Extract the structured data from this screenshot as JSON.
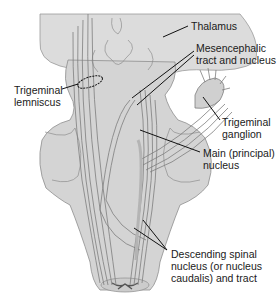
{
  "figure": {
    "type": "anatomical-diagram",
    "colors": {
      "tissue_fill": "#d4d4d4",
      "tissue_stroke": "#8e8e8e",
      "fiber_stroke": "#7d7d7d",
      "leader_line": "#111111",
      "label_text": "#1a1a1a"
    }
  },
  "labels": {
    "thalamus": {
      "lines": [
        "Thalamus"
      ]
    },
    "mesencephalic": {
      "lines": [
        "Mesencephalic",
        "tract and nucleus"
      ]
    },
    "lemniscus": {
      "lines": [
        "Trigeminal",
        "lemniscus"
      ]
    },
    "ganglion": {
      "lines": [
        "Trigeminal",
        "ganglion"
      ]
    },
    "main_nucleus": {
      "lines": [
        "Main (principal)",
        "nucleus"
      ]
    },
    "descending": {
      "lines": [
        "Descending spinal",
        "nucleus (or nucleus",
        "caudalis) and tract"
      ]
    }
  }
}
